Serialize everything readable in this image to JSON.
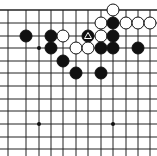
{
  "board": {
    "xs": [
      8,
      26,
      39,
      51,
      63,
      76,
      88,
      101,
      113,
      126,
      138,
      150
    ],
    "ys": [
      10,
      23,
      36,
      48,
      61,
      73,
      86,
      99,
      111,
      124,
      137,
      149
    ],
    "star_points": [
      [
        2,
        3
      ],
      [
        2,
        9
      ],
      [
        8,
        9
      ]
    ],
    "stones": [
      {
        "color": "white",
        "col": 8,
        "row": 0
      },
      {
        "color": "white",
        "col": 7,
        "row": 1
      },
      {
        "color": "black",
        "col": 8,
        "row": 1
      },
      {
        "color": "white",
        "col": 9,
        "row": 1
      },
      {
        "color": "white",
        "col": 10,
        "row": 1
      },
      {
        "color": "white",
        "col": 11,
        "row": 1
      },
      {
        "color": "black",
        "col": 1,
        "row": 2
      },
      {
        "color": "black",
        "col": 3,
        "row": 2
      },
      {
        "color": "white",
        "col": 4,
        "row": 2
      },
      {
        "color": "black",
        "col": 6,
        "row": 2,
        "mark": "triangle"
      },
      {
        "color": "white",
        "col": 7,
        "row": 2
      },
      {
        "color": "black",
        "col": 8,
        "row": 2
      },
      {
        "color": "black",
        "col": 3,
        "row": 3
      },
      {
        "color": "white",
        "col": 5,
        "row": 3
      },
      {
        "color": "white",
        "col": 6,
        "row": 3
      },
      {
        "color": "black",
        "col": 7,
        "row": 3
      },
      {
        "color": "black",
        "col": 8,
        "row": 3
      },
      {
        "color": "black",
        "col": 10,
        "row": 3
      },
      {
        "color": "black",
        "col": 4,
        "row": 4
      },
      {
        "color": "black",
        "col": 5,
        "row": 5
      },
      {
        "color": "black",
        "col": 7,
        "row": 5
      }
    ]
  }
}
